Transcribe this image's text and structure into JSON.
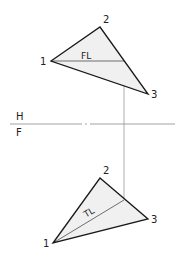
{
  "figure": {
    "top_cut_text": "",
    "folding_line": {
      "top_label": "H",
      "bottom_label": "F"
    },
    "top_view": {
      "vertices": [
        {
          "label": "1",
          "x": 51,
          "y": 61
        },
        {
          "label": "2",
          "x": 100,
          "y": 27
        },
        {
          "label": "3",
          "x": 148,
          "y": 94
        }
      ],
      "line_label": "FL"
    },
    "front_view": {
      "vertices": [
        {
          "label": "1",
          "x": 53,
          "y": 243
        },
        {
          "label": "2",
          "x": 100,
          "y": 178
        },
        {
          "label": "3",
          "x": 148,
          "y": 219
        }
      ],
      "line_label": "TL"
    },
    "colors": {
      "edge": "#1a1a1a",
      "fill": "#f0f0f0",
      "construction": "#8a8a8a"
    }
  }
}
